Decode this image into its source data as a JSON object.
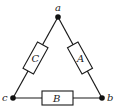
{
  "diagram": {
    "type": "delta-circuit",
    "nodes": {
      "a": {
        "label": "a"
      },
      "b": {
        "label": "b"
      },
      "c": {
        "label": "c"
      }
    },
    "elements": {
      "A": {
        "label": "A",
        "between": "a-b"
      },
      "B": {
        "label": "B",
        "between": "b-c"
      },
      "C": {
        "label": "C",
        "between": "a-c"
      }
    },
    "colors": {
      "line": "#1a1a1a",
      "background": "#ffffff"
    }
  }
}
